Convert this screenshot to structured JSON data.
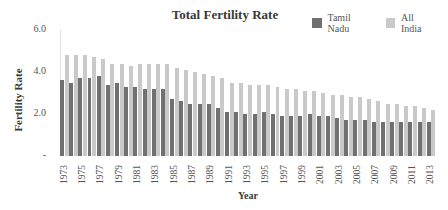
{
  "chart_data": {
    "type": "bar",
    "title": "Total Fertility Rate",
    "xlabel": "Year",
    "ylabel": "Fertility Rate",
    "ylim": [
      0,
      6
    ],
    "yticks": [
      {
        "value": 6,
        "label": "6.0"
      },
      {
        "value": 4,
        "label": "4.0"
      },
      {
        "value": 2,
        "label": "2.0"
      },
      {
        "value": 0,
        "label": "-"
      }
    ],
    "grid": false,
    "legend_position": "top-right",
    "categories": [
      "1973",
      "1974",
      "1975",
      "1976",
      "1977",
      "1978",
      "1979",
      "1980",
      "1981",
      "1982",
      "1983",
      "1984",
      "1985",
      "1986",
      "1987",
      "1988",
      "1989",
      "1990",
      "1991",
      "1992",
      "1993",
      "1994",
      "1995",
      "1996",
      "1997",
      "1998",
      "1999",
      "2000",
      "2001",
      "2002",
      "2003",
      "2004",
      "2005",
      "2006",
      "2007",
      "2008",
      "2009",
      "2010",
      "2011",
      "2012",
      "2013"
    ],
    "xtick_labels": [
      "1973",
      "1975",
      "1977",
      "1979",
      "1981",
      "1983",
      "1985",
      "1987",
      "1989",
      "1991",
      "1993",
      "1995",
      "1997",
      "1999",
      "2001",
      "2003",
      "2005",
      "2007",
      "2009",
      "2011",
      "2013"
    ],
    "series": [
      {
        "name": "Tamil Nadu",
        "color": "#707070",
        "values": [
          3.6,
          3.5,
          3.7,
          3.7,
          3.8,
          3.4,
          3.5,
          3.3,
          3.3,
          3.2,
          3.2,
          3.2,
          2.7,
          2.6,
          2.5,
          2.5,
          2.5,
          2.3,
          2.1,
          2.1,
          2.0,
          2.0,
          2.1,
          2.0,
          1.9,
          1.9,
          1.9,
          2.0,
          1.9,
          1.9,
          1.8,
          1.7,
          1.7,
          1.7,
          1.6,
          1.6,
          1.6,
          1.6,
          1.6,
          1.6,
          1.6
        ]
      },
      {
        "name": "All India",
        "color": "#c9c9c9",
        "values": [
          4.8,
          4.8,
          4.8,
          4.7,
          4.6,
          4.4,
          4.4,
          4.3,
          4.4,
          4.4,
          4.4,
          4.4,
          4.2,
          4.1,
          4.0,
          3.9,
          3.8,
          3.7,
          3.5,
          3.5,
          3.4,
          3.4,
          3.4,
          3.3,
          3.2,
          3.2,
          3.1,
          3.1,
          3.0,
          2.9,
          2.9,
          2.8,
          2.8,
          2.7,
          2.6,
          2.5,
          2.5,
          2.4,
          2.4,
          2.3,
          2.2
        ]
      }
    ]
  }
}
